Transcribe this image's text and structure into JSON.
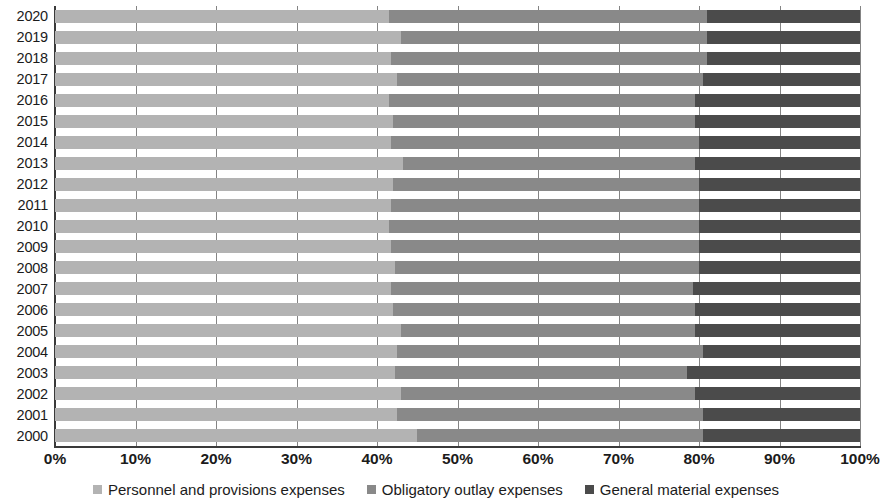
{
  "chart_data": {
    "type": "bar",
    "orientation": "horizontal",
    "stacked": true,
    "stack_mode": "percent",
    "title": "",
    "subtitle": "",
    "xlabel": "",
    "ylabel": "",
    "xlim": [
      0,
      100
    ],
    "grid": true,
    "legend_position": "bottom",
    "x_tick_labels": [
      "0%",
      "10%",
      "20%",
      "30%",
      "40%",
      "50%",
      "60%",
      "70%",
      "80%",
      "90%",
      "100%"
    ],
    "x_tick_values": [
      0,
      10,
      20,
      30,
      40,
      50,
      60,
      70,
      80,
      90,
      100
    ],
    "categories": [
      "2020",
      "2019",
      "2018",
      "2017",
      "2016",
      "2015",
      "2014",
      "2013",
      "2012",
      "2011",
      "2010",
      "2009",
      "2008",
      "2007",
      "2006",
      "2005",
      "2004",
      "2003",
      "2002",
      "2001",
      "2000"
    ],
    "series": [
      {
        "name": "Personnel and provisions expenses",
        "color": "#b3b3b3",
        "values": [
          41.5,
          43.0,
          41.8,
          42.5,
          41.5,
          42.0,
          41.8,
          43.2,
          42.0,
          41.8,
          41.5,
          41.8,
          42.2,
          41.8,
          42.0,
          43.0,
          42.5,
          42.2,
          43.0,
          42.5,
          45.0
        ]
      },
      {
        "name": "Obligatory outlay expenses",
        "color": "#898989",
        "values": [
          39.5,
          38.0,
          39.2,
          38.0,
          38.0,
          37.5,
          38.2,
          36.3,
          38.0,
          38.2,
          38.5,
          38.2,
          37.8,
          37.5,
          37.5,
          36.5,
          38.0,
          36.3,
          36.5,
          38.0,
          35.5
        ]
      },
      {
        "name": "General material expenses",
        "color": "#4b4b4b",
        "values": [
          19.0,
          19.0,
          19.0,
          19.5,
          20.5,
          20.5,
          20.0,
          20.5,
          20.0,
          20.0,
          20.0,
          20.0,
          20.0,
          20.7,
          20.5,
          20.5,
          19.5,
          21.5,
          20.5,
          19.5,
          19.5
        ]
      }
    ],
    "legend": [
      {
        "label": "Personnel and provisions expenses",
        "color": "#b3b3b3",
        "swatch": "personnel"
      },
      {
        "label": "Obligatory outlay expenses",
        "color": "#898989",
        "swatch": "obligatory"
      },
      {
        "label": "General material expenses",
        "color": "#4b4b4b",
        "swatch": "material"
      }
    ],
    "colors": {
      "personnel": "#b3b3b3",
      "obligatory": "#898989",
      "material": "#4b4b4b",
      "axis": "#3a3a3a",
      "gridline": "#6e6e6e",
      "text": "#1b1b1b",
      "background": "#ffffff"
    }
  }
}
